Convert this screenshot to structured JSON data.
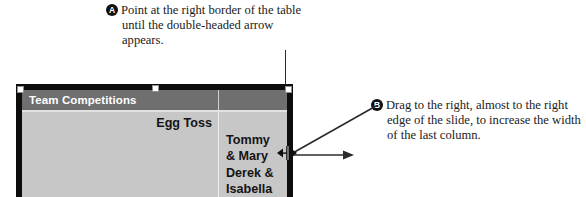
{
  "callouts": [
    {
      "marker": "A",
      "text": "Point at the right border of the table until the double-headed arrow appears."
    },
    {
      "marker": "B",
      "text": "Drag to the right, almost to the right edge of the slide, to increase the width of the last column."
    }
  ],
  "table": {
    "headers": [
      "Team Competitions",
      ""
    ],
    "rows": [
      [
        "Egg Toss",
        "Tommy\n& Mary\nDerek &\nIsabella"
      ]
    ]
  },
  "colors": {
    "header_bg": "#6f6f6f",
    "header_text": "#ffffff",
    "body_bg": "#c7c7c7",
    "slide_border": "#0d0d0d",
    "marker_bg": "#111111",
    "leader_line": "#2b2b2b"
  },
  "icons": {
    "resize_cursor": "horizontal-resize-cursor-icon",
    "arrow_right": "arrow-right-icon"
  }
}
